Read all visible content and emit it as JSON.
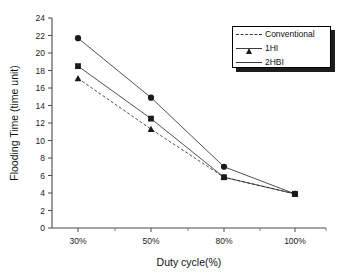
{
  "chart_data": {
    "type": "line",
    "title": "",
    "xlabel": "Duty cycle(%)",
    "ylabel": "Flooding Time (time unit)",
    "categories": [
      "30%",
      "50%",
      "80%",
      "100%"
    ],
    "ylim": [
      0,
      24
    ],
    "yticks": [
      0,
      2,
      4,
      6,
      8,
      10,
      12,
      14,
      16,
      18,
      20,
      22,
      24
    ],
    "grid": false,
    "legend_position": "top-right",
    "series": [
      {
        "name": "Conventional",
        "marker": "triangle",
        "line_style": "dashed",
        "color": "#1a1a1a",
        "values": [
          17.1,
          11.3,
          5.8,
          3.9
        ]
      },
      {
        "name": "1HI",
        "marker": "square",
        "line_style": "solid",
        "color": "#1a1a1a",
        "values": [
          18.5,
          12.5,
          5.8,
          3.9
        ]
      },
      {
        "name": "2HBI",
        "marker": "circle",
        "line_style": "solid",
        "color": "#1a1a1a",
        "values": [
          21.7,
          14.9,
          7.0,
          3.9
        ]
      }
    ]
  },
  "axis": {
    "y_tick_labels": [
      "0",
      "2",
      "4",
      "6",
      "8",
      "10",
      "12",
      "14",
      "16",
      "18",
      "20",
      "22",
      "24"
    ],
    "x_tick_labels": [
      "30%",
      "50%",
      "80%",
      "100%"
    ],
    "x_title": "Duty cycle(%)",
    "y_title": "Flooding Time (time unit)"
  },
  "legend": {
    "items": [
      {
        "label": "Conventional",
        "marker": "triangle-marker-icon"
      },
      {
        "label": "1HI",
        "marker": "square-marker-icon"
      },
      {
        "label": "2HBI",
        "marker": "circle-marker-icon"
      }
    ]
  }
}
